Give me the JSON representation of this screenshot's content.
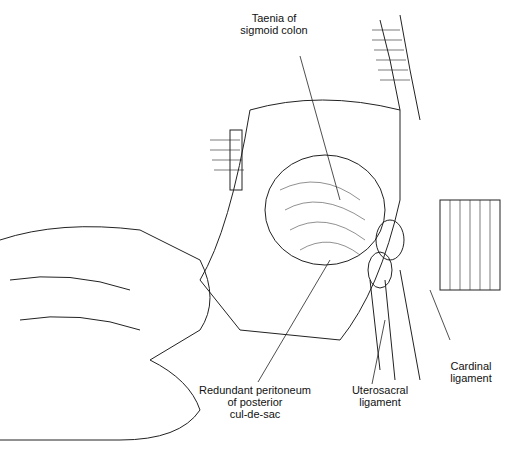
{
  "figure": {
    "type": "surgical anatomy illustration",
    "labels": [
      {
        "id": "taenia",
        "text": "Taenia of\nsigmoid colon"
      },
      {
        "id": "redundant",
        "text": "Redundant peritoneum\nof posterior\ncul-de-sac"
      },
      {
        "id": "uterosacral",
        "text": "Uterosacral\nligament"
      },
      {
        "id": "cardinal",
        "text": "Cardinal\nligament"
      }
    ]
  }
}
